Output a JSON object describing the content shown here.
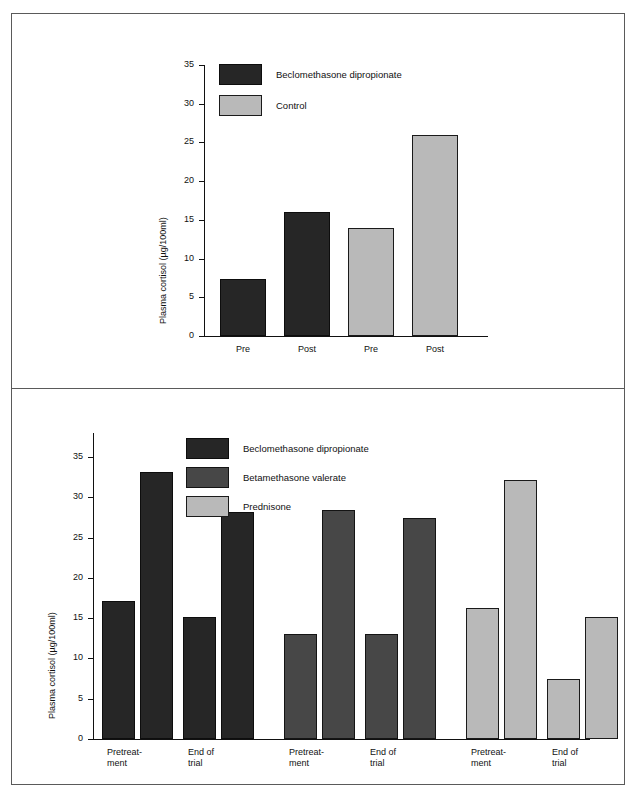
{
  "figure": {
    "frame_color": "#5a5a5a",
    "background": "#ffffff"
  },
  "series_colors": {
    "beclomethasone": "#262626",
    "betamethasone": "#474747",
    "prednisone": "#b9b9b9",
    "control": "#b9b9b9"
  },
  "chart_data": [
    {
      "type": "bar",
      "id": "top-chart",
      "title": "",
      "xlabel": "",
      "ylabel": "Plasma cortisol (µg/100ml)",
      "ylim": [
        0,
        35
      ],
      "yticks": [
        0,
        5,
        10,
        15,
        20,
        25,
        30,
        35
      ],
      "ytick_labels": [
        "0",
        "5",
        "10",
        "15",
        "20",
        "25",
        "30",
        "35"
      ],
      "grid": false,
      "legend_position": "top-left-inside",
      "categories": [
        "Pre",
        "Post",
        "Pre",
        "Post"
      ],
      "legend": [
        {
          "label": "Beclomethasone dipropionate",
          "color_key": "dark"
        },
        {
          "label": "Control",
          "color_key": "light"
        }
      ],
      "bars": [
        {
          "category": "Pre",
          "value": 7.4,
          "series": "Beclomethasone dipropionate",
          "color_key": "dark"
        },
        {
          "category": "Post",
          "value": 16.0,
          "series": "Beclomethasone dipropionate",
          "color_key": "dark"
        },
        {
          "category": "Pre",
          "value": 14.0,
          "series": "Control",
          "color_key": "light"
        },
        {
          "category": "Post",
          "value": 26.0,
          "series": "Control",
          "color_key": "light"
        }
      ]
    },
    {
      "type": "bar",
      "id": "bottom-chart",
      "title": "",
      "xlabel": "",
      "ylabel": "Plasma cortisol (µg/100ml)",
      "ylim": [
        0,
        38
      ],
      "yticks": [
        0,
        5,
        10,
        15,
        20,
        25,
        30,
        35
      ],
      "ytick_labels": [
        "0",
        "5",
        "10",
        "15",
        "20",
        "25",
        "30",
        "35"
      ],
      "grid": false,
      "legend_position": "top-center-inside",
      "categories": [
        "Pretreat-\nment",
        "End of\ntrial",
        "Pretreat-\nment",
        "End of\ntrial",
        "Pretreat-\nment",
        "End of\ntrial"
      ],
      "legend": [
        {
          "label": "Beclomethasone dipropionate",
          "color_key": "dark"
        },
        {
          "label": "Betamethasone valerate",
          "color_key": "mid"
        },
        {
          "label": "Prednisone",
          "color_key": "light"
        }
      ],
      "groups": [
        {
          "series": "Beclomethasone dipropionate",
          "color_key": "dark",
          "bars": [
            {
              "category": "Pretreat-\nment",
              "value": 17.1
            },
            {
              "category": "Pretreat-\nment",
              "value": 33.2
            },
            {
              "category": "End of\ntrial",
              "value": 15.1
            },
            {
              "category": "End of\ntrial",
              "value": 28.2
            }
          ]
        },
        {
          "series": "Betamethasone valerate",
          "color_key": "mid",
          "bars": [
            {
              "category": "Pretreat-\nment",
              "value": 13.1
            },
            {
              "category": "Pretreat-\nment",
              "value": 28.5
            },
            {
              "category": "End of\ntrial",
              "value": 13.0
            },
            {
              "category": "End of\ntrial",
              "value": 27.5
            }
          ]
        },
        {
          "series": "Prednisone",
          "color_key": "light",
          "bars": [
            {
              "category": "Pretreat-\nment",
              "value": 16.3
            },
            {
              "category": "Pretreat-\nment",
              "value": 32.2
            },
            {
              "category": "End of\ntrial",
              "value": 7.4
            },
            {
              "category": "End of\ntrial",
              "value": 15.2
            }
          ]
        }
      ]
    }
  ]
}
